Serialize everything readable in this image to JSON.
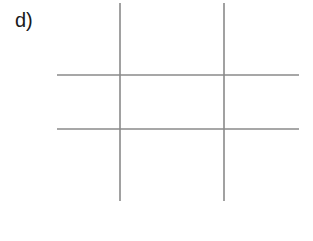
{
  "figure": {
    "label": "d)",
    "line_color": "#8a8a8a",
    "vertical_lines": [
      {
        "x": 120,
        "y1": 3,
        "y2": 201
      },
      {
        "x": 224,
        "y1": 3,
        "y2": 201
      }
    ],
    "horizontal_lines": [
      {
        "y": 75,
        "x1": 57,
        "x2": 299
      },
      {
        "y": 129,
        "x1": 57,
        "x2": 299
      }
    ]
  }
}
